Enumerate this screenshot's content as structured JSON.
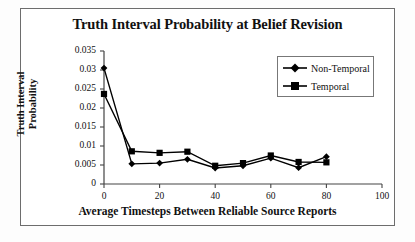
{
  "chart_data": {
    "type": "line",
    "title": "Truth Interval Probability at Belief Revision",
    "xlabel": "Average Timesteps Between Reliable Source Reports",
    "ylabel_line1": "Truth Interval",
    "ylabel_line2": "Probability",
    "ylabel": "Truth Interval Probability",
    "x": [
      0,
      10,
      20,
      30,
      40,
      50,
      60,
      70,
      80
    ],
    "xlim": [
      0,
      100
    ],
    "ylim": [
      0,
      0.035
    ],
    "xticks": [
      "0",
      "20",
      "40",
      "60",
      "80",
      "100"
    ],
    "xtick_values": [
      0,
      20,
      40,
      60,
      80,
      100
    ],
    "yticks": [
      "0",
      "0.005",
      "0.01",
      "0.015",
      "0.02",
      "0.025",
      "0.03",
      "0.035"
    ],
    "ytick_values": [
      0,
      0.005,
      0.01,
      0.015,
      0.02,
      0.025,
      0.03,
      0.035
    ],
    "grid": false,
    "legend_position": "top-right",
    "series": [
      {
        "name": "Non-Temporal",
        "marker": "diamond",
        "color": "#000000",
        "values": [
          0.0305,
          0.0053,
          0.0055,
          0.0065,
          0.0042,
          0.0048,
          0.0068,
          0.0043,
          0.0072
        ]
      },
      {
        "name": "Temporal",
        "marker": "square",
        "color": "#000000",
        "values": [
          0.0237,
          0.0086,
          0.0082,
          0.0085,
          0.0048,
          0.0055,
          0.0075,
          0.0058,
          0.0057
        ]
      }
    ]
  }
}
